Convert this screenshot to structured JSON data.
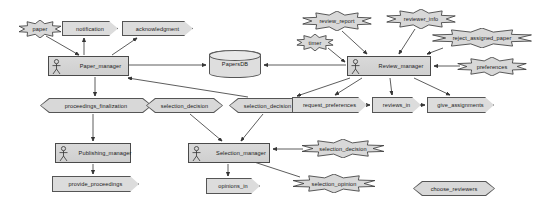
{
  "diagram": {
    "type": "activity-component-diagram",
    "colors": {
      "node_fill": "#d8d8d8",
      "node_stroke": "#555555",
      "edge_stroke": "#333333",
      "background": "#ffffff",
      "text": "#1a1a1a"
    },
    "nodes": [
      {
        "id": "paper",
        "label": "paper",
        "shape": "burst",
        "x": 18,
        "y": 20,
        "w": 44,
        "h": 18
      },
      {
        "id": "notification",
        "label": "notification",
        "shape": "flow",
        "x": 62,
        "y": 21,
        "w": 56,
        "h": 15
      },
      {
        "id": "acknowledgment",
        "label": "acknowledgment",
        "shape": "flow",
        "x": 122,
        "y": 21,
        "w": 71,
        "h": 15
      },
      {
        "id": "paper_manager",
        "label": "Paper_manager",
        "shape": "manager",
        "x": 48,
        "y": 56,
        "w": 81,
        "h": 20
      },
      {
        "id": "papersdb",
        "label": "PapersDB",
        "shape": "datastore",
        "x": 209,
        "y": 50,
        "w": 52,
        "h": 28
      },
      {
        "id": "review_manager",
        "label": "Review_manager",
        "shape": "manager",
        "x": 347,
        "y": 56,
        "w": 84,
        "h": 20
      },
      {
        "id": "review_report",
        "label": "review_report",
        "shape": "burst",
        "x": 301,
        "y": 11,
        "w": 72,
        "h": 20
      },
      {
        "id": "reviewer_info",
        "label": "reviewer_info",
        "shape": "burst",
        "x": 385,
        "y": 9,
        "w": 72,
        "h": 20
      },
      {
        "id": "timer",
        "label": "timer",
        "shape": "burst",
        "x": 296,
        "y": 34,
        "w": 38,
        "h": 17
      },
      {
        "id": "reject_assigned_paper",
        "label": "reject_assigned_paper",
        "shape": "burst",
        "x": 430,
        "y": 28,
        "w": 104,
        "h": 20
      },
      {
        "id": "preferences",
        "label": "preferences",
        "shape": "burst",
        "x": 456,
        "y": 57,
        "w": 72,
        "h": 19
      },
      {
        "id": "proceedings_finalization",
        "label": "proceedings_finalization",
        "shape": "hex",
        "x": 40,
        "y": 98,
        "w": 112,
        "h": 15
      },
      {
        "id": "selection_decision_1",
        "label": "selection_decision",
        "shape": "hex",
        "x": 146,
        "y": 98,
        "w": 77,
        "h": 15
      },
      {
        "id": "selection_decision_2",
        "label": "selection_decision",
        "shape": "hex",
        "x": 229,
        "y": 98,
        "w": 77,
        "h": 15
      },
      {
        "id": "request_preferences",
        "label": "request_preferences",
        "shape": "flow",
        "x": 292,
        "y": 97,
        "w": 75,
        "h": 16
      },
      {
        "id": "reviews_in",
        "label": "reviews_in",
        "shape": "flow",
        "x": 372,
        "y": 97,
        "w": 49,
        "h": 16
      },
      {
        "id": "give_assignments",
        "label": "give_assignments",
        "shape": "flow",
        "x": 427,
        "y": 97,
        "w": 67,
        "h": 16
      },
      {
        "id": "publishing_manager",
        "label": "Publishing_manager",
        "shape": "manager",
        "x": 55,
        "y": 143,
        "w": 76,
        "h": 20
      },
      {
        "id": "selection_manager",
        "label": "Selection_manager",
        "shape": "manager",
        "x": 188,
        "y": 143,
        "w": 82,
        "h": 20
      },
      {
        "id": "selection_decision_3",
        "label": "selection_decision",
        "shape": "burst",
        "x": 300,
        "y": 139,
        "w": 86,
        "h": 19
      },
      {
        "id": "provide_proceedings",
        "label": "provide_proceedings",
        "shape": "flow",
        "x": 52,
        "y": 176,
        "w": 87,
        "h": 16
      },
      {
        "id": "opinions_in",
        "label": "opinions_in",
        "shape": "flow",
        "x": 206,
        "y": 178,
        "w": 54,
        "h": 16
      },
      {
        "id": "selection_opinion",
        "label": "selection_opinion",
        "shape": "burst",
        "x": 291,
        "y": 174,
        "w": 86,
        "h": 19
      },
      {
        "id": "choose_reviewers",
        "label": "choose_reviewers",
        "shape": "hex",
        "x": 413,
        "y": 181,
        "w": 82,
        "h": 15
      }
    ],
    "edges": [
      {
        "from": "paper",
        "to": "paper_manager",
        "arrow": true
      },
      {
        "from": "paper_manager",
        "to": "notification",
        "arrow": true
      },
      {
        "from": "paper_manager",
        "to": "acknowledgment",
        "arrow": true
      },
      {
        "from": "paper_manager",
        "to": "papersdb",
        "arrow": true
      },
      {
        "from": "review_manager",
        "to": "papersdb",
        "arrow": true
      },
      {
        "from": "review_report",
        "to": "review_manager",
        "arrow": true
      },
      {
        "from": "reviewer_info",
        "to": "review_manager",
        "arrow": true
      },
      {
        "from": "timer",
        "to": "review_manager",
        "arrow": true
      },
      {
        "from": "reject_assigned_paper",
        "to": "review_manager",
        "arrow": true
      },
      {
        "from": "preferences",
        "to": "review_manager",
        "arrow": true
      },
      {
        "from": "paper_manager",
        "to": "proceedings_finalization",
        "arrow": true
      },
      {
        "from": "selection_decision_1",
        "to": "selection_manager",
        "arrow": true
      },
      {
        "from": "selection_decision_2",
        "to": "selection_manager",
        "arrow": true
      },
      {
        "from": "selection_decision_2",
        "to": "paper_manager",
        "arrow": true
      },
      {
        "from": "review_manager",
        "to": "request_preferences",
        "arrow": true
      },
      {
        "from": "review_manager",
        "to": "reviews_in",
        "arrow": true
      },
      {
        "from": "review_manager",
        "to": "give_assignments",
        "arrow": true
      },
      {
        "from": "review_manager",
        "to": "selection_decision_2",
        "arrow": true
      },
      {
        "from": "proceedings_finalization",
        "to": "publishing_manager",
        "arrow": true
      },
      {
        "from": "publishing_manager",
        "to": "provide_proceedings",
        "arrow": true
      },
      {
        "from": "selection_manager",
        "to": "opinions_in",
        "arrow": true
      },
      {
        "from": "selection_decision_3",
        "to": "selection_manager",
        "arrow": true
      },
      {
        "from": "selection_opinion",
        "to": "selection_manager",
        "arrow": true
      },
      {
        "from": "request_preferences",
        "to": "reviews_in",
        "arrow": true
      },
      {
        "from": "reviews_in",
        "to": "give_assignments",
        "arrow": true
      }
    ]
  }
}
